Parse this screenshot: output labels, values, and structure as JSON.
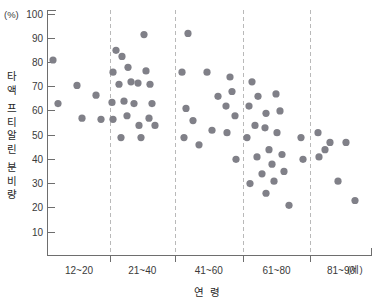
{
  "chart_data": {
    "type": "scatter",
    "title": "",
    "xlabel": "연 령",
    "ylabel": "타액 프티알린 분비량",
    "y_unit": "(%)",
    "x_unit": "(세)",
    "ylim": [
      0,
      100
    ],
    "yticks": [
      10,
      20,
      30,
      40,
      50,
      60,
      70,
      80,
      90,
      100
    ],
    "categories": [
      "12~20",
      "21~40",
      "41~60",
      "61~80",
      "81~90"
    ],
    "grid": "vertical-dashed-category-separators",
    "legend": "none",
    "marker_color": "#808088",
    "series": [
      {
        "name": "타액 프티알린 분비량",
        "points": [
          {
            "group": "12~20",
            "x": 53,
            "y": 81
          },
          {
            "group": "12~20",
            "x": 58,
            "y": 63
          },
          {
            "group": "12~20",
            "x": 77,
            "y": 70.5
          },
          {
            "group": "12~20",
            "x": 82,
            "y": 57
          },
          {
            "group": "12~20",
            "x": 96,
            "y": 66.5
          },
          {
            "group": "12~20",
            "x": 101,
            "y": 56.5
          },
          {
            "group": "21~40",
            "x": 116,
            "y": 85
          },
          {
            "group": "21~40",
            "x": 122,
            "y": 82.5
          },
          {
            "group": "21~40",
            "x": 113,
            "y": 76
          },
          {
            "group": "21~40",
            "x": 128,
            "y": 78
          },
          {
            "group": "21~40",
            "x": 119,
            "y": 71
          },
          {
            "group": "21~40",
            "x": 131,
            "y": 72
          },
          {
            "group": "21~40",
            "x": 138,
            "y": 71.5
          },
          {
            "group": "21~40",
            "x": 112,
            "y": 63.5
          },
          {
            "group": "21~40",
            "x": 124,
            "y": 64
          },
          {
            "group": "21~40",
            "x": 134,
            "y": 63
          },
          {
            "group": "21~40",
            "x": 144,
            "y": 91.5
          },
          {
            "group": "21~40",
            "x": 146,
            "y": 76.5
          },
          {
            "group": "21~40",
            "x": 150,
            "y": 71
          },
          {
            "group": "21~40",
            "x": 152,
            "y": 63
          },
          {
            "group": "21~40",
            "x": 113,
            "y": 56.5
          },
          {
            "group": "21~40",
            "x": 127,
            "y": 58
          },
          {
            "group": "21~40",
            "x": 139,
            "y": 54
          },
          {
            "group": "21~40",
            "x": 149,
            "y": 57
          },
          {
            "group": "21~40",
            "x": 155,
            "y": 54
          },
          {
            "group": "21~40",
            "x": 121,
            "y": 49
          },
          {
            "group": "21~40",
            "x": 141,
            "y": 49
          },
          {
            "group": "41~60",
            "x": 188,
            "y": 92
          },
          {
            "group": "41~60",
            "x": 182,
            "y": 76
          },
          {
            "group": "41~60",
            "x": 186,
            "y": 61
          },
          {
            "group": "41~60",
            "x": 193,
            "y": 56
          },
          {
            "group": "41~60",
            "x": 184,
            "y": 49
          },
          {
            "group": "41~60",
            "x": 199,
            "y": 46
          },
          {
            "group": "41~60",
            "x": 207,
            "y": 76
          },
          {
            "group": "41~60",
            "x": 212,
            "y": 52
          },
          {
            "group": "41~60",
            "x": 218,
            "y": 66
          },
          {
            "group": "41~60",
            "x": 230,
            "y": 74
          },
          {
            "group": "41~60",
            "x": 232,
            "y": 68
          },
          {
            "group": "41~60",
            "x": 226,
            "y": 62
          },
          {
            "group": "41~60",
            "x": 235,
            "y": 58
          },
          {
            "group": "41~60",
            "x": 227,
            "y": 51
          },
          {
            "group": "41~60",
            "x": 236,
            "y": 40
          },
          {
            "group": "61~80",
            "x": 252,
            "y": 72
          },
          {
            "group": "61~80",
            "x": 258,
            "y": 66
          },
          {
            "group": "61~80",
            "x": 249,
            "y": 62
          },
          {
            "group": "61~80",
            "x": 266,
            "y": 59
          },
          {
            "group": "61~80",
            "x": 255,
            "y": 54
          },
          {
            "group": "61~80",
            "x": 265,
            "y": 53
          },
          {
            "group": "61~80",
            "x": 247,
            "y": 49
          },
          {
            "group": "61~80",
            "x": 276,
            "y": 67
          },
          {
            "group": "61~80",
            "x": 280,
            "y": 60
          },
          {
            "group": "61~80",
            "x": 277,
            "y": 51
          },
          {
            "group": "61~80",
            "x": 269,
            "y": 44
          },
          {
            "group": "61~80",
            "x": 257,
            "y": 41
          },
          {
            "group": "61~80",
            "x": 272,
            "y": 38
          },
          {
            "group": "61~80",
            "x": 282,
            "y": 42
          },
          {
            "group": "61~80",
            "x": 284,
            "y": 35
          },
          {
            "group": "61~80",
            "x": 262,
            "y": 34
          },
          {
            "group": "61~80",
            "x": 274,
            "y": 31
          },
          {
            "group": "61~80",
            "x": 250,
            "y": 30
          },
          {
            "group": "61~80",
            "x": 266,
            "y": 26
          },
          {
            "group": "61~80",
            "x": 289,
            "y": 21
          },
          {
            "group": "61~80",
            "x": 301,
            "y": 49
          },
          {
            "group": "61~80",
            "x": 303,
            "y": 40
          },
          {
            "group": "81~90",
            "x": 318,
            "y": 51
          },
          {
            "group": "81~90",
            "x": 330,
            "y": 47
          },
          {
            "group": "81~90",
            "x": 325,
            "y": 44
          },
          {
            "group": "81~90",
            "x": 346,
            "y": 47
          },
          {
            "group": "81~90",
            "x": 319,
            "y": 41
          },
          {
            "group": "81~90",
            "x": 338,
            "y": 31
          },
          {
            "group": "81~90",
            "x": 355,
            "y": 23
          }
        ]
      }
    ]
  },
  "axis": {
    "y_unit_label": "(%)",
    "x_unit_label": "(세)",
    "x_title": "연 령",
    "y_title_chars": [
      "타",
      "액",
      "프",
      "티",
      "알",
      "린",
      "분",
      "비",
      "량"
    ]
  }
}
